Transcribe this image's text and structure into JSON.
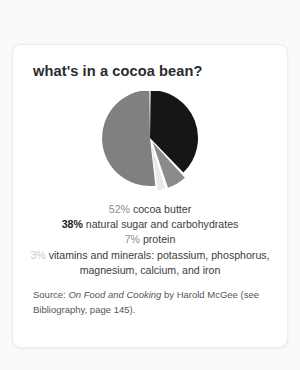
{
  "card": {
    "title": "what's in a cocoa bean?"
  },
  "chart_data": {
    "type": "pie",
    "title": "what's in a cocoa bean?",
    "legend_position": "below",
    "grid": false,
    "categories": [
      "cocoa butter",
      "natural sugar and carbohydrates",
      "protein",
      "vitamins and minerals: potassium, phosphorus, magnesium, calcium, and iron"
    ],
    "values": [
      52,
      38,
      7,
      3
    ],
    "value_labels": [
      "52%",
      "38%",
      "7%",
      "3%"
    ],
    "colors": [
      "#808082",
      "#161618",
      "#8b8b8d",
      "#e9e9ea"
    ],
    "exploded": [
      false,
      false,
      true,
      true
    ],
    "slices": [
      {
        "label": "cocoa butter",
        "value": 52,
        "value_label": "52%",
        "color": "#808082",
        "text_color": "#8d8d8f",
        "exploded": false
      },
      {
        "label": "natural sugar and carbohydrates",
        "value": 38,
        "value_label": "38%",
        "color": "#161618",
        "text_color": "#232325",
        "exploded": false
      },
      {
        "label": "protein",
        "value": 7,
        "value_label": "7%",
        "color": "#8b8b8d",
        "text_color": "#8d8d8f",
        "exploded": true
      },
      {
        "label": "vitamins and minerals: potassium, phosphorus, magnesium, calcium, and iron",
        "value": 3,
        "value_label": "3%",
        "color": "#e9e9ea",
        "text_color": "#cbcbcc",
        "exploded": true
      }
    ]
  },
  "legend": {
    "rows": [
      {
        "pct": "52%",
        "text": " cocoa butter"
      },
      {
        "pct": "38%",
        "text": " natural sugar and carbohydrates"
      },
      {
        "pct": "7%",
        "text": " protein"
      },
      {
        "pct": "3%",
        "text": " vitamins and minerals: potassium, phosphorus, magnesium, calcium, and iron"
      }
    ]
  },
  "source": {
    "prefix": "Source: ",
    "book_title": "On Food and Cooking",
    "middle": " by Harold McGee",
    "suffix": "(see Bibliography, page 145)."
  }
}
